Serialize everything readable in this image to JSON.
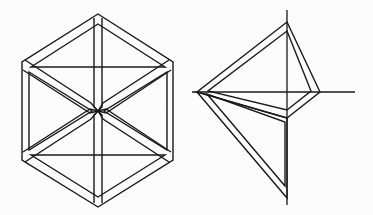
{
  "canvas": {
    "width": 373,
    "height": 215,
    "background_color": "#fcfcfd",
    "ink_color": "#1a1a1a"
  },
  "figures": [
    {
      "id": "hexagon-star-figure",
      "name": "hexagon-with-six-triangles",
      "description": "Regular hexagon subdivided into six triangular bands meeting at the center, drawn with double outlines",
      "stroke_width": 1.4,
      "center": [
        98,
        111
      ],
      "outer_vertices": [
        [
          98,
          14
        ],
        [
          173,
          62
        ],
        [
          173,
          160
        ],
        [
          98,
          207
        ],
        [
          22,
          160
        ],
        [
          22,
          62
        ]
      ],
      "triangle_count": 6,
      "band_inset": 5
    },
    {
      "id": "kite-axes-figure",
      "name": "kite-with-crossing-axes",
      "description": "Kite quadrilateral outlined as a double-line band, overlaid by a vertical and a horizontal axis line that extend beyond it, with an inner notch band",
      "stroke_width": 1.4,
      "kite_vertices": [
        [
          287,
          22
        ],
        [
          320,
          92
        ],
        [
          287,
          118
        ],
        [
          197,
          92
        ]
      ],
      "band_inset": 4,
      "vertical_axis": {
        "x": 287,
        "y1": 10,
        "y2": 205
      },
      "horizontal_axis": {
        "y": 92,
        "x1": 192,
        "x2": 355
      },
      "lower_triangle_vertices": [
        [
          197,
          92
        ],
        [
          287,
          198
        ],
        [
          287,
          118
        ]
      ]
    }
  ]
}
